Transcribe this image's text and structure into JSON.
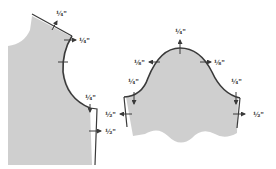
{
  "colors": {
    "fill": "#cfcfcf",
    "line": "#3a3a3a",
    "background": "#ffffff"
  },
  "bodice": {
    "labels": {
      "shoulder": "¼\"",
      "armhole_top": "¼\"",
      "underarm": "¼\"",
      "side_seam": "½\""
    }
  },
  "sleeve": {
    "labels": {
      "cap_top": "¼\"",
      "cap_left": "⅛\"",
      "cap_right": "⅛\"",
      "underarm_left": "¼\"",
      "underarm_right": "¼\"",
      "seam_left": "½\"",
      "seam_right": "½\""
    }
  }
}
